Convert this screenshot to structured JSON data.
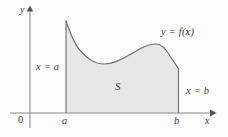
{
  "figure": {
    "caption_labels": {
      "y_axis": "y",
      "x_axis": "x",
      "origin": "0",
      "tick_a": "a",
      "tick_b": "b",
      "left_boundary": "x = a",
      "right_boundary": "x = b",
      "region": "S",
      "curve": "y = f(x)"
    },
    "colors": {
      "region_fill": "#e7e7e7",
      "curve_stroke": "#6f6f6f",
      "axis_stroke": "#8a8a8a",
      "label_text": "#3a3a3a",
      "background": "#fdfdfd"
    }
  },
  "chart_data": {
    "type": "area",
    "title": "",
    "subtitle": "",
    "xlabel": "x",
    "ylabel": "y",
    "legend": [],
    "grid": false,
    "annotations": [
      {
        "text": "y = f(x)",
        "x": 161,
        "y": 27
      },
      {
        "text": "S",
        "x": 115,
        "y": 81
      },
      {
        "text": "x = a",
        "x": 36,
        "y": 62
      },
      {
        "text": "x = b",
        "x": 186,
        "y": 86
      }
    ],
    "axis": {
      "x_axis_y_px": 113,
      "y_axis_x_px": 30,
      "x_axis_start_px": 10,
      "x_axis_end_px": 215,
      "y_axis_top_px": 8,
      "y_axis_bottom_px": 128,
      "tick_labels_x": [
        "0",
        "a",
        "b"
      ],
      "tick_positions_x_px": [
        22,
        65,
        177
      ]
    },
    "region": {
      "name": "S",
      "x_lower_bound": "a",
      "x_upper_bound": "b",
      "x_lower_px": 66,
      "x_upper_px": 178.5,
      "baseline_px": 113,
      "description": "Area under the curve y = f(x) from x = a to x = b"
    },
    "curve_points_px": [
      [
        66,
        21
      ],
      [
        74,
        38
      ],
      [
        82,
        50
      ],
      [
        90,
        58
      ],
      [
        98,
        63
      ],
      [
        106,
        64
      ],
      [
        114,
        62
      ],
      [
        122,
        58
      ],
      [
        131,
        54
      ],
      [
        140,
        50
      ],
      [
        148,
        46
      ],
      [
        156,
        44
      ],
      [
        163,
        45
      ],
      [
        169,
        51
      ],
      [
        174,
        60
      ],
      [
        178.5,
        69
      ]
    ],
    "curve_path": "M 66 21 C 70 32 73 42 79 49 C 86 58 94 64 104 64 C 114 64 122 59 131 54 C 140 49 147 44 156 44 C 162 44 166 49 170 56 C 174 62 177 66 178.5 69"
  }
}
